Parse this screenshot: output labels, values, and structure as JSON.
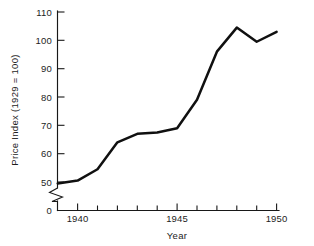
{
  "chart_data": {
    "type": "line",
    "title": "",
    "xlabel": "Year",
    "ylabel": "Price Index (1929 = 100)",
    "x": [
      1939,
      1940,
      1941,
      1942,
      1943,
      1944,
      1945,
      1946,
      1947,
      1948,
      1949,
      1950
    ],
    "values": [
      49.5,
      50.5,
      54.5,
      64.0,
      67.0,
      67.5,
      69.0,
      79.0,
      96.0,
      104.5,
      99.5,
      103.0
    ],
    "series": [
      {
        "name": "Price Index (1929 = 100)",
        "values": [
          49.5,
          50.5,
          54.5,
          64.0,
          67.0,
          67.5,
          69.0,
          79.0,
          96.0,
          104.5,
          99.5,
          103.0
        ]
      }
    ],
    "xlim": [
      1939,
      1950
    ],
    "ylim": [
      50,
      110
    ],
    "y_axis_broken": true,
    "y_break_between": [
      0,
      50
    ],
    "y_zero_label": "0",
    "grid": false,
    "legend": "none",
    "line_color": "#101010",
    "background_color": "#ffffff",
    "y_ticks": [
      50,
      60,
      70,
      80,
      90,
      100,
      110
    ],
    "y_tick_labels": [
      "50",
      "60",
      "70",
      "80",
      "90",
      "100",
      "110"
    ],
    "x_ticks": [
      1940,
      1941,
      1942,
      1943,
      1944,
      1945,
      1946,
      1947,
      1948,
      1949,
      1950
    ],
    "x_tick_labels_shown": [
      "1940",
      "1945",
      "1950"
    ],
    "x_labeled_ticks": [
      1940,
      1945,
      1950
    ]
  },
  "axes": {
    "y_title": "Price Index (1929 = 100)",
    "x_title": "Year",
    "y_labels": [
      "110",
      "100",
      "90",
      "80",
      "70",
      "60",
      "50",
      "0"
    ],
    "x_labels": [
      "1940",
      "1945",
      "1950"
    ]
  }
}
